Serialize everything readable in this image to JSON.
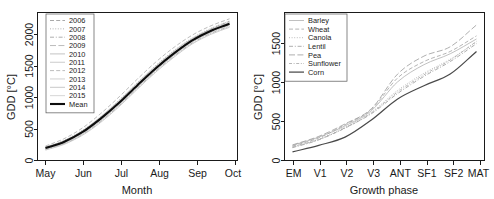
{
  "figure": {
    "panels": [
      "left",
      "right"
    ]
  },
  "chart_data": [
    {
      "type": "line",
      "title": "",
      "xlabel": "Month",
      "ylabel": "GDD [°C]",
      "xticks": [
        "May",
        "Jun",
        "Jul",
        "Aug",
        "Sep",
        "Oct"
      ],
      "yticks": [
        0,
        500,
        1000,
        1500,
        2000
      ],
      "ylim": [
        0,
        2350
      ],
      "xlim": [
        0,
        5
      ],
      "grid": false,
      "legend_position": "top-left",
      "x": [
        0,
        0.5,
        1,
        1.5,
        2,
        2.5,
        3,
        3.5,
        4,
        4.5,
        5
      ],
      "series": [
        {
          "name": "2006",
          "style": "dashed",
          "color": "#9a9a9a",
          "values": [
            200,
            300,
            460,
            680,
            930,
            1210,
            1480,
            1720,
            1930,
            2090,
            2210
          ]
        },
        {
          "name": "2007",
          "style": "dotted",
          "color": "#a5a5a5",
          "values": [
            215,
            320,
            480,
            700,
            960,
            1240,
            1510,
            1750,
            1950,
            2100,
            2215
          ]
        },
        {
          "name": "2008",
          "style": "dashdot",
          "color": "#9f9f9f",
          "values": [
            175,
            265,
            410,
            620,
            870,
            1150,
            1420,
            1660,
            1870,
            2020,
            2130
          ]
        },
        {
          "name": "2009",
          "style": "longdash",
          "color": "#adadad",
          "values": [
            190,
            285,
            435,
            650,
            900,
            1180,
            1450,
            1690,
            1900,
            2050,
            2160
          ]
        },
        {
          "name": "2010",
          "style": "solid",
          "color": "#b8b8b8",
          "values": [
            210,
            310,
            470,
            690,
            950,
            1230,
            1500,
            1740,
            1940,
            2085,
            2190
          ]
        },
        {
          "name": "2011",
          "style": "solid",
          "color": "#c2c2c2",
          "values": [
            165,
            255,
            400,
            605,
            855,
            1135,
            1405,
            1645,
            1855,
            2005,
            2115
          ]
        },
        {
          "name": "2012",
          "style": "dashed",
          "color": "#b0b0b0",
          "values": [
            230,
            345,
            515,
            745,
            1010,
            1295,
            1565,
            1800,
            1995,
            2140,
            2250
          ]
        },
        {
          "name": "2013",
          "style": "solid",
          "color": "#c8c8c8",
          "values": [
            180,
            272,
            420,
            632,
            882,
            1162,
            1432,
            1672,
            1882,
            2032,
            2142
          ]
        },
        {
          "name": "2014",
          "style": "solid",
          "color": "#bdbdbd",
          "values": [
            205,
            302,
            455,
            672,
            925,
            1205,
            1472,
            1712,
            1918,
            2068,
            2178
          ]
        },
        {
          "name": "2015",
          "style": "solid",
          "color": "#cfcfcf",
          "values": [
            195,
            292,
            445,
            660,
            912,
            1192,
            1462,
            1700,
            1908,
            2058,
            2168
          ]
        },
        {
          "name": "Mean",
          "style": "solid-bold",
          "color": "#0d0d0d",
          "values": [
            197,
            295,
            449,
            665,
            916,
            1196,
            1465,
            1704,
            1911,
            2061,
            2170
          ]
        }
      ]
    },
    {
      "type": "line",
      "title": "",
      "xlabel": "Growth phase",
      "ylabel": "GDD [°C]",
      "xticks": [
        "EM",
        "V1",
        "V2",
        "V3",
        "ANT",
        "SF1",
        "SF2",
        "MAT"
      ],
      "yticks": [
        0,
        500,
        1000,
        1500
      ],
      "ylim": [
        0,
        1900
      ],
      "xlim": [
        0,
        7
      ],
      "grid": false,
      "legend_position": "top-left",
      "x": [
        0,
        1,
        2,
        3,
        4,
        5,
        6,
        7
      ],
      "series": [
        {
          "name": "Barley",
          "style": "solid",
          "color": "#b5b5b5",
          "values": [
            195,
            300,
            445,
            640,
            1010,
            1230,
            1370,
            1560
          ]
        },
        {
          "name": "Wheat",
          "style": "dashed",
          "color": "#a8a8a8",
          "values": [
            185,
            290,
            460,
            655,
            1060,
            1270,
            1400,
            1600
          ]
        },
        {
          "name": "Canola",
          "style": "dotted",
          "color": "#b0b0b0",
          "values": [
            175,
            275,
            430,
            620,
            900,
            1120,
            1300,
            1520
          ]
        },
        {
          "name": "Lentil",
          "style": "dashdot",
          "color": "#9e9e9e",
          "values": [
            165,
            265,
            420,
            600,
            860,
            1080,
            1270,
            1500
          ]
        },
        {
          "name": "Pea",
          "style": "longdash",
          "color": "#a0a0a0",
          "values": [
            200,
            310,
            470,
            665,
            1110,
            1340,
            1460,
            1740
          ]
        },
        {
          "name": "Sunflower",
          "style": "dashed2",
          "color": "#aaaaaa",
          "values": [
            170,
            270,
            415,
            610,
            880,
            1100,
            1290,
            1530
          ]
        },
        {
          "name": "Corn",
          "style": "solid-dark",
          "color": "#4a4a4a",
          "values": [
            110,
            195,
            300,
            520,
            790,
            960,
            1110,
            1400
          ]
        }
      ]
    }
  ]
}
